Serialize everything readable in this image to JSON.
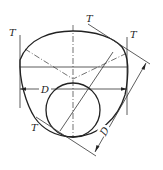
{
  "diagram": {
    "type": "geometric-construction",
    "labels": {
      "tangent_top": "T",
      "tangent_left": "T",
      "tangent_right": "T",
      "tangent_bottom": "T",
      "dim_horizontal": "D",
      "dim_diagonal": "D"
    },
    "colors": {
      "line": "#222222",
      "background": "#ffffff"
    }
  }
}
